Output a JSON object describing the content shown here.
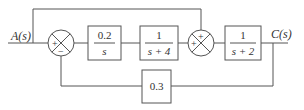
{
  "diagram": {
    "type": "control-block-diagram",
    "input_label": "A(s)",
    "output_label": "C(s)",
    "blocks": [
      {
        "id": "g1",
        "numerator": "0.2",
        "denominator": "s"
      },
      {
        "id": "g2",
        "numerator": "1",
        "denominator": "s + 4"
      },
      {
        "id": "g3",
        "numerator": "1",
        "denominator": "s + 2"
      },
      {
        "id": "h",
        "value": "0.3"
      }
    ],
    "summing_junctions": [
      {
        "id": "sum1",
        "signs": {
          "left": "+",
          "bottom": "−"
        }
      },
      {
        "id": "sum2",
        "signs": {
          "top": "+",
          "left": "+"
        }
      }
    ],
    "connections": [
      "A(s) → sum1 (+)",
      "A(s) → sum2 (+, feedforward over top)",
      "sum1 → g1 → g2 → sum2 (+)",
      "sum2 → g3 → C(s)",
      "C(s) → h → sum1 (−)"
    ]
  }
}
